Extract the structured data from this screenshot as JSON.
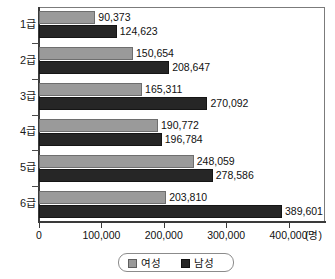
{
  "chart_data": {
    "type": "bar",
    "orientation": "horizontal",
    "title": "",
    "xlabel": "",
    "ylabel": "",
    "unit": "(명)",
    "xlim": [
      0,
      400000
    ],
    "xticks": [
      0,
      100000,
      200000,
      300000,
      400000
    ],
    "xtick_labels": [
      "0",
      "100,000",
      "200,000",
      "300,000",
      "400,000"
    ],
    "categories": [
      "1급",
      "2급",
      "3급",
      "4급",
      "5급",
      "6급"
    ],
    "grid": false,
    "legend_position": "bottom",
    "series": [
      {
        "name": "여성",
        "color": "#9a9a9a",
        "values": [
          90373,
          150654,
          165311,
          190772,
          248059,
          203810
        ],
        "labels": [
          "90,373",
          "150,654",
          "165,311",
          "190,772",
          "248,059",
          "203,810"
        ]
      },
      {
        "name": "남성",
        "color": "#262626",
        "values": [
          124623,
          208647,
          270092,
          196784,
          278586,
          389601
        ],
        "labels": [
          "124,623",
          "208,647",
          "270,092",
          "196,784",
          "278,586",
          "389,601"
        ]
      }
    ]
  },
  "legend": {
    "items": [
      {
        "label": "여성",
        "swatch": "female"
      },
      {
        "label": "남성",
        "swatch": "male"
      }
    ]
  }
}
